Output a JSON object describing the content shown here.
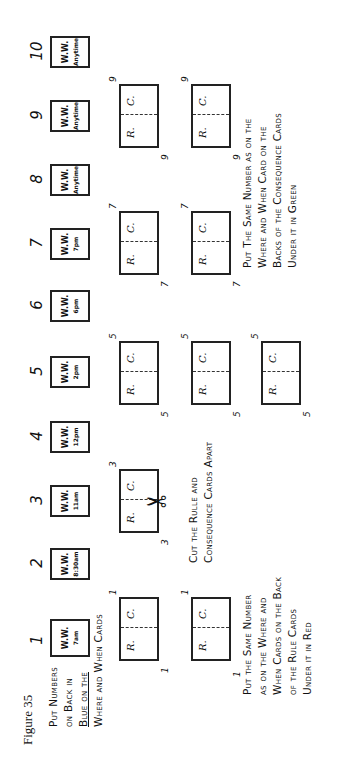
{
  "figure_label": "Figure 35",
  "where_when_cards": [
    {
      "number": "1",
      "front": "W.W.",
      "time": "7am"
    },
    {
      "number": "2",
      "front": "W.W.",
      "time": "8:30am"
    },
    {
      "number": "3",
      "front": "W.W.",
      "time": "11am"
    },
    {
      "number": "4",
      "front": "W.W.",
      "time": "12pm"
    },
    {
      "number": "5",
      "front": "W.W.",
      "time": "2pm"
    },
    {
      "number": "6",
      "front": "W.W.",
      "time": "6pm"
    },
    {
      "number": "7",
      "front": "W.W.",
      "time": "7pm"
    },
    {
      "number": "8",
      "front": "W.W.",
      "time": "Anytime"
    },
    {
      "number": "9",
      "front": "W.W.",
      "time": "Anytime"
    },
    {
      "number": "10",
      "front": "W.W.",
      "time": "Anytime"
    }
  ],
  "rule_consequence_card": {
    "left_label": "R.",
    "right_label": "C."
  },
  "rc_rows": [
    {
      "row": 1,
      "numbers": [
        "1",
        "3",
        "5",
        "7",
        "9"
      ]
    },
    {
      "row": 2,
      "numbers": [
        "1",
        "5",
        "7",
        "9"
      ]
    },
    {
      "row": 3,
      "numbers": [
        "5"
      ]
    }
  ],
  "instructions": {
    "blue": {
      "lines": [
        "Put Numbers",
        "on Back in",
        "Blue on the",
        "Where and When Cards"
      ],
      "color_word": "Blue"
    },
    "cut": {
      "lines": [
        "Cut the Rulle and",
        "Consequence Cards Apart"
      ]
    },
    "red": {
      "lines": [
        "Put the Same Number",
        "as on the Where and",
        "When Cards on the Back",
        "of the Rule Cards",
        "Under it in Red"
      ],
      "color_word": "Red"
    },
    "green": {
      "lines": [
        "Put The Same Number as on the",
        "Where and When Card on the",
        "Backs of the Consequence Cards",
        "Under it in Green"
      ],
      "color_word": "Green"
    }
  },
  "icons": {
    "scissors": "✂",
    "arrow": "↗"
  }
}
